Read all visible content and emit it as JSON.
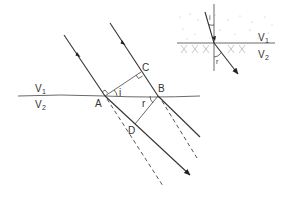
{
  "diagram": {
    "labels": {
      "point_a": "A",
      "point_b": "B",
      "point_c": "C",
      "point_d": "D",
      "angle_incidence": "i",
      "angle_refraction": "r",
      "medium_1": "V",
      "medium_1_sub": "1",
      "medium_2": "V",
      "medium_2_sub": "2"
    },
    "inset": {
      "angle_incidence": "i",
      "angle_refraction": "r",
      "medium_1": "V",
      "medium_1_sub": "1",
      "medium_2": "V",
      "medium_2_sub": "2"
    }
  }
}
